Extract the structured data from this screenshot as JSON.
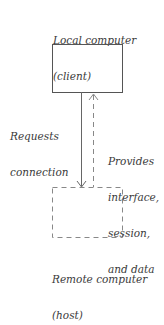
{
  "diagram": {
    "client": {
      "title": "Local computer",
      "subtitle": "(client)"
    },
    "host": {
      "title": "Remote computer",
      "subtitle": "(host)"
    },
    "request_arrow": {
      "line1": "Requests",
      "line2": "connection"
    },
    "response_arrow": {
      "line1": "Provides",
      "line2": "interface,",
      "line3": "session,",
      "line4": "and data"
    }
  },
  "colors": {
    "solid_stroke": "#555555",
    "dashed_stroke": "#888888"
  }
}
